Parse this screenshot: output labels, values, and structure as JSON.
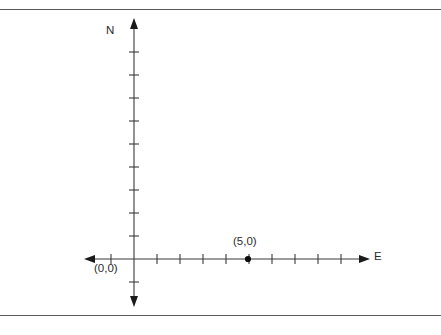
{
  "diagram": {
    "axes": {
      "vertical": {
        "name": "north-axis",
        "label": "N",
        "x": 134,
        "top_y": 18,
        "bottom_y": 307,
        "double_headed": true
      },
      "horizontal": {
        "name": "east-axis",
        "label": "E",
        "y": 259,
        "left_x": 84,
        "right_x": 370,
        "double_headed": true
      }
    },
    "origin": {
      "label": "(0,0)",
      "x": 134,
      "y": 259
    },
    "points": [
      {
        "label": "(5,0)",
        "x": 248,
        "y": 259,
        "value_x": 5,
        "value_y": 0
      }
    ],
    "tick_spacing_px": 23,
    "ticks_horizontal_left": 1,
    "ticks_horizontal_right": 9,
    "ticks_vertical_up": 11,
    "ticks_vertical_down": 1,
    "tick_half_length_px": 5,
    "colors": {
      "axis": "#3a3a3a",
      "text": "#2b2b2b",
      "rule": "#5a5a5a",
      "point": "#0d0d0d",
      "background": "#ffffff"
    }
  },
  "frame": {
    "top_rule_y": 9,
    "bottom_rule_y": 315
  }
}
